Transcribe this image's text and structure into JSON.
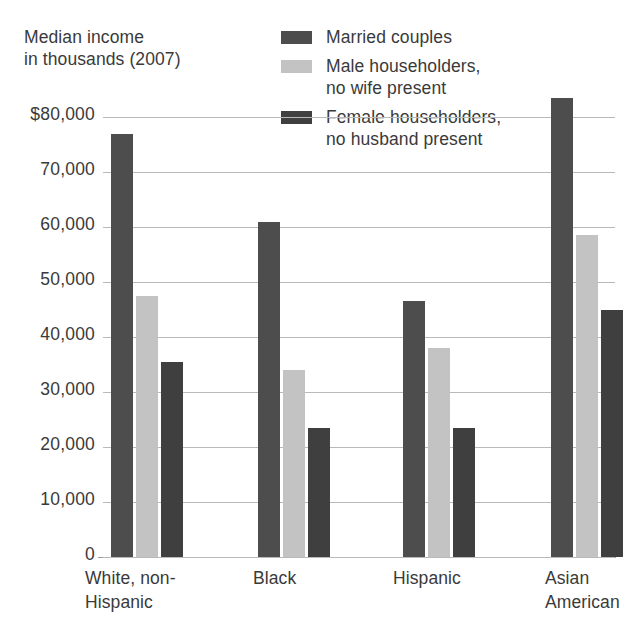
{
  "chart_data": {
    "type": "bar",
    "title": "",
    "subtitle": "",
    "axis_caption": "Median income\nin thousands (2007)",
    "xlabel": "",
    "ylabel": "",
    "ylim": [
      0,
      80000
    ],
    "ytick_values": [
      0,
      10000,
      20000,
      30000,
      40000,
      50000,
      60000,
      70000,
      80000
    ],
    "ytick_labels": [
      "0",
      "10,000",
      "20,000",
      "30,000",
      "40,000",
      "50,000",
      "60,000",
      "70,000",
      "$80,000"
    ],
    "grid": true,
    "legend_position": "top-right",
    "categories": [
      "White, non-\nHispanic",
      "Black",
      "Hispanic",
      "Asian\nAmerican"
    ],
    "category_labels_flat": [
      "White, non-Hispanic",
      "Black",
      "Hispanic",
      "Asian American"
    ],
    "series": [
      {
        "name": "Married couples",
        "color": "#4d4d4d",
        "values": [
          77000,
          61000,
          46500,
          83500
        ]
      },
      {
        "name": "Male householders,\nno wife present",
        "color": "#c3c3c3",
        "values": [
          47500,
          34000,
          38000,
          58500
        ]
      },
      {
        "name": "Female householders,\nno husband present",
        "color": "#3f3f3f",
        "values": [
          35500,
          23500,
          23500,
          45000
        ]
      }
    ]
  },
  "legend": {
    "items": [
      {
        "label": "Married couples",
        "color": "#4d4d4d",
        "swatch_name": "legend-swatch-married-couples"
      },
      {
        "label": "Male householders,\nno wife present",
        "color": "#c3c3c3",
        "swatch_name": "legend-swatch-male-householders"
      },
      {
        "label": "Female householders,\nno husband present",
        "color": "#3f3f3f",
        "swatch_name": "legend-swatch-female-householders"
      }
    ]
  },
  "axis": {
    "caption": "Median income\nin thousands (2007)"
  },
  "colors": {
    "married": "#4d4d4d",
    "male": "#c3c3c3",
    "female": "#3f3f3f",
    "gridline": "#b9b9b9",
    "axis": "#9a9a9a",
    "text": "#3a3a3a",
    "background": "#ffffff"
  }
}
